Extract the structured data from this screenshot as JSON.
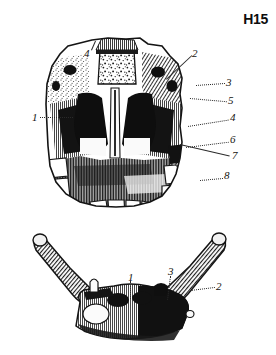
{
  "plate": {
    "code": "H15",
    "background_color": "#ffffff",
    "ink_color": "#15140f"
  },
  "figures": [
    {
      "id": "maxilla-coronal-section",
      "name": "Coronal section of maxilla and nasal cavity",
      "position": "top",
      "labels": [
        {
          "text": "4",
          "x": 84,
          "y": 48
        },
        {
          "text": "2",
          "x": 192,
          "y": 48
        },
        {
          "text": "1",
          "x": 32,
          "y": 112
        },
        {
          "text": "3",
          "x": 226,
          "y": 77
        },
        {
          "text": "5",
          "x": 228,
          "y": 95
        },
        {
          "text": "4",
          "x": 230,
          "y": 112
        },
        {
          "text": "6",
          "x": 230,
          "y": 134
        },
        {
          "text": "7",
          "x": 232,
          "y": 150
        },
        {
          "text": "8",
          "x": 224,
          "y": 170
        }
      ]
    },
    {
      "id": "mandible-superior-view",
      "name": "Mandible seen from above",
      "position": "bottom",
      "labels": [
        {
          "text": "1",
          "x": 128,
          "y": 272
        },
        {
          "text": "3",
          "x": 168,
          "y": 266
        },
        {
          "text": "2",
          "x": 216,
          "y": 281
        }
      ]
    }
  ],
  "leaders": [
    {
      "figure": "maxilla-coronal-section",
      "from_label": "4",
      "x1": 91,
      "y1": 50,
      "x2": 95,
      "y2": 41,
      "style": "solid"
    },
    {
      "figure": "maxilla-coronal-section",
      "from_label": "2",
      "x1": 191,
      "y1": 55,
      "x2": 166,
      "y2": 79,
      "style": "solid"
    },
    {
      "figure": "maxilla-coronal-section",
      "from_label": "1",
      "x1": 40,
      "y1": 117,
      "x2": 72,
      "y2": 117,
      "style": "dotted"
    },
    {
      "figure": "maxilla-coronal-section",
      "from_label": "3",
      "x1": 224,
      "y1": 83,
      "x2": 196,
      "y2": 85,
      "style": "dotted"
    },
    {
      "figure": "maxilla-coronal-section",
      "from_label": "5",
      "x1": 226,
      "y1": 101,
      "x2": 190,
      "y2": 98,
      "style": "dotted"
    },
    {
      "figure": "maxilla-coronal-section",
      "from_label": "4",
      "x1": 228,
      "y1": 120,
      "x2": 188,
      "y2": 126,
      "style": "dotted"
    },
    {
      "figure": "maxilla-coronal-section",
      "from_label": "6",
      "x1": 228,
      "y1": 142,
      "x2": 186,
      "y2": 147,
      "style": "dotted"
    },
    {
      "figure": "maxilla-coronal-section",
      "from_label": "7",
      "x1": 230,
      "y1": 156,
      "x2": 180,
      "y2": 144,
      "style": "solid"
    },
    {
      "figure": "maxilla-coronal-section",
      "from_label": "8",
      "x1": 222,
      "y1": 178,
      "x2": 200,
      "y2": 180,
      "style": "dotted"
    },
    {
      "figure": "mandible-superior-view",
      "from_label": "1",
      "x1": 131,
      "y1": 281,
      "x2": 131,
      "y2": 299,
      "style": "dotted"
    },
    {
      "figure": "mandible-superior-view",
      "from_label": "3",
      "x1": 171,
      "y1": 276,
      "x2": 168,
      "y2": 300,
      "style": "dotted"
    },
    {
      "figure": "mandible-superior-view",
      "from_label": "2",
      "x1": 214,
      "y1": 287,
      "x2": 190,
      "y2": 290,
      "style": "dotted"
    }
  ]
}
